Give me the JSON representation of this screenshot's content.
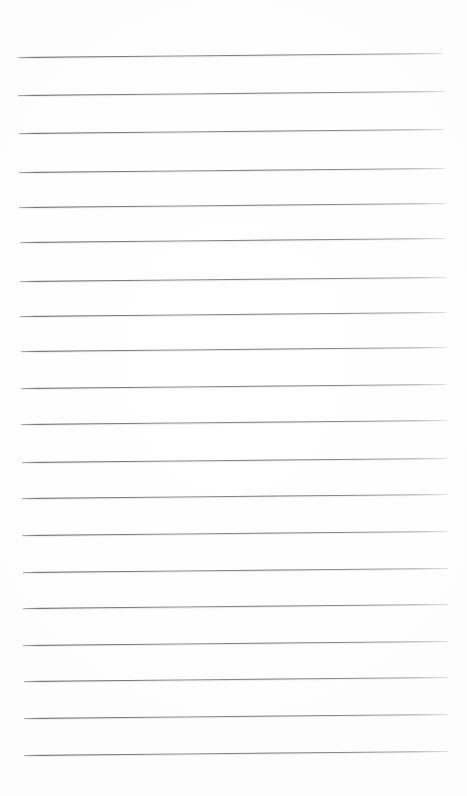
{
  "page": {
    "kind": "blank-ruled-paper",
    "width": 467,
    "height": 796,
    "background_color": "#ffffff",
    "has_text": false,
    "has_margin_rule": false,
    "has_holes": false,
    "note": ""
  },
  "ruling": {
    "line_color": "#5c5c62",
    "line_thickness_px": 1,
    "line_count": 20,
    "average_spacing_px": 36.7,
    "left_margin_px": 18,
    "right_margin_px": 443,
    "line_length_px": 425,
    "skew_degrees": -0.55,
    "first_line_y_px": 57,
    "last_line_y_px": 755,
    "lines": [
      {
        "index": 1,
        "y": 57,
        "x_start": 18,
        "x_end": 443
      },
      {
        "index": 2,
        "y": 95,
        "x_start": 18,
        "x_end": 444
      },
      {
        "index": 3,
        "y": 133,
        "x_start": 19,
        "x_end": 444
      },
      {
        "index": 4,
        "y": 172,
        "x_start": 19,
        "x_end": 445
      },
      {
        "index": 5,
        "y": 207,
        "x_start": 19,
        "x_end": 445
      },
      {
        "index": 6,
        "y": 242,
        "x_start": 20,
        "x_end": 445
      },
      {
        "index": 7,
        "y": 281,
        "x_start": 20,
        "x_end": 446
      },
      {
        "index": 8,
        "y": 316,
        "x_start": 20,
        "x_end": 446
      },
      {
        "index": 9,
        "y": 351,
        "x_start": 21,
        "x_end": 446
      },
      {
        "index": 10,
        "y": 388,
        "x_start": 21,
        "x_end": 446
      },
      {
        "index": 11,
        "y": 424,
        "x_start": 21,
        "x_end": 447
      },
      {
        "index": 12,
        "y": 462,
        "x_start": 22,
        "x_end": 447
      },
      {
        "index": 13,
        "y": 498,
        "x_start": 22,
        "x_end": 447
      },
      {
        "index": 14,
        "y": 535,
        "x_start": 22,
        "x_end": 447
      },
      {
        "index": 15,
        "y": 572,
        "x_start": 23,
        "x_end": 448
      },
      {
        "index": 16,
        "y": 608,
        "x_start": 23,
        "x_end": 448
      },
      {
        "index": 17,
        "y": 645,
        "x_start": 23,
        "x_end": 448
      },
      {
        "index": 18,
        "y": 681,
        "x_start": 24,
        "x_end": 448
      },
      {
        "index": 19,
        "y": 718,
        "x_start": 24,
        "x_end": 448
      },
      {
        "index": 20,
        "y": 755,
        "x_start": 24,
        "x_end": 448
      }
    ]
  }
}
